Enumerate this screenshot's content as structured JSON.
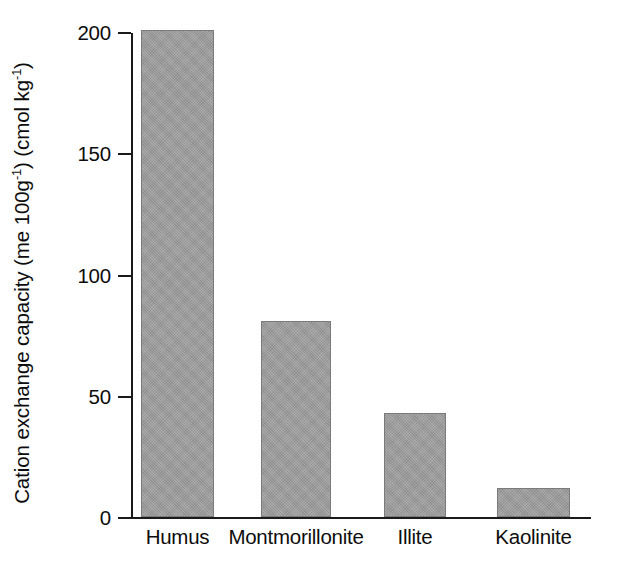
{
  "chart_data": {
    "type": "bar",
    "title": "",
    "xlabel": "",
    "ylabel": "Cation exchange capacity (me 100g-1) (cmol kg-1)",
    "ylabel_parts": {
      "main": "Cation exchange capacity (me 100g",
      "sup1": "-1",
      "mid": ") (cmol kg",
      "sup2": "-1",
      "end": ")"
    },
    "categories": [
      "Humus",
      "Montmorillonite",
      "Illite",
      "Kaolinite"
    ],
    "values": [
      201,
      81,
      43,
      12
    ],
    "ylim": [
      0,
      200
    ],
    "yticks": [
      0,
      50,
      100,
      150,
      200
    ],
    "ytick_labels": [
      "0",
      "50",
      "100",
      "150",
      "200"
    ],
    "grid": false,
    "legend": false,
    "bar_color": "#9a9a9a",
    "bar_edge_color": "#7b7b7b",
    "axis_color": "#1a1a1a"
  },
  "bars": [
    {
      "label": "Humus",
      "value": 201,
      "left": 10,
      "width": 73
    },
    {
      "label": "Montmorillonite",
      "value": 81,
      "left": 130,
      "width": 70
    },
    {
      "label": "Illite",
      "value": 43,
      "left": 253,
      "width": 62
    },
    {
      "label": "Kaolinite",
      "value": 12,
      "left": 366,
      "width": 73
    }
  ]
}
